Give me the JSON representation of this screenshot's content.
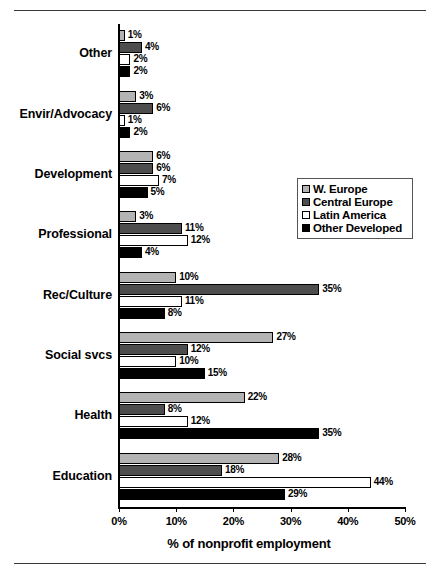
{
  "chart_data": {
    "type": "bar",
    "orientation": "horizontal",
    "title": "",
    "xlabel": "% of nonprofit employment",
    "ylabel": "",
    "xlim": [
      0,
      50
    ],
    "xtick_labels": [
      "0%",
      "10%",
      "20%",
      "30%",
      "40%",
      "50%"
    ],
    "xticks": [
      0,
      10,
      20,
      30,
      40,
      50
    ],
    "grid": false,
    "legend_position": "center-right",
    "value_label_suffix": "%",
    "categories": [
      "Other",
      "Envir/Advocacy",
      "Development",
      "Professional",
      "Rec/Culture",
      "Social svcs",
      "Health",
      "Education"
    ],
    "series": [
      {
        "name": "W. Europe",
        "color": "#b3b3b3",
        "values": [
          1,
          3,
          6,
          3,
          10,
          27,
          22,
          28
        ],
        "labels": [
          "1%",
          "3%",
          "6%",
          "3%",
          "10%",
          "27%",
          "22%",
          "28%"
        ]
      },
      {
        "name": "Central Europe",
        "color": "#4d4d4d",
        "values": [
          4,
          6,
          6,
          11,
          35,
          12,
          8,
          18
        ],
        "labels": [
          "4%",
          "6%",
          "6%",
          "11%",
          "35%",
          "12%",
          "8%",
          "18%"
        ]
      },
      {
        "name": "Latin America",
        "color": "#ffffff",
        "values": [
          2,
          1,
          7,
          12,
          11,
          10,
          12,
          44
        ],
        "labels": [
          "2%",
          "1%",
          "7%",
          "12%",
          "11%",
          "10%",
          "12%",
          "44%"
        ]
      },
      {
        "name": "Other Developed",
        "color": "#000000",
        "values": [
          2,
          2,
          5,
          4,
          8,
          15,
          35,
          29
        ],
        "labels": [
          "2%",
          "2%",
          "5%",
          "4%",
          "8%",
          "15%",
          "35%",
          "29%"
        ]
      }
    ]
  },
  "legend": {
    "items": [
      {
        "label": "W. Europe",
        "color": "#b3b3b3"
      },
      {
        "label": "Central Europe",
        "color": "#4d4d4d"
      },
      {
        "label": "Latin America",
        "color": "#ffffff"
      },
      {
        "label": "Other Developed",
        "color": "#000000"
      }
    ]
  }
}
